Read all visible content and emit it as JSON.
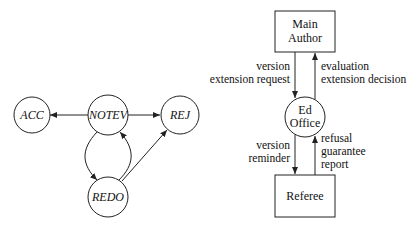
{
  "state_diagram": {
    "nodes": [
      {
        "id": "acc",
        "label": "ACC"
      },
      {
        "id": "notev",
        "label": "NOTEV"
      },
      {
        "id": "rej",
        "label": "REJ"
      },
      {
        "id": "redo",
        "label": "REDO"
      }
    ],
    "edges": [
      {
        "from": "NOTEV",
        "to": "ACC"
      },
      {
        "from": "NOTEV",
        "to": "REJ"
      },
      {
        "from": "NOTEV",
        "to": "REDO"
      },
      {
        "from": "REDO",
        "to": "NOTEV"
      },
      {
        "from": "REDO",
        "to": "REJ"
      }
    ]
  },
  "flow_diagram": {
    "main_author": {
      "line1": "Main",
      "line2": "Author"
    },
    "ed_office": {
      "line1": "Ed",
      "line2": "Office"
    },
    "referee": {
      "label": "Referee"
    },
    "author_to_office": {
      "line1": "version",
      "line2": "extension request"
    },
    "office_to_author": {
      "line1": "evaluation",
      "line2": "extension decision"
    },
    "office_to_referee": {
      "line1": "version",
      "line2": "reminder"
    },
    "referee_to_office": {
      "line1": "refusal",
      "line2": "guarantee",
      "line3": "report"
    }
  }
}
